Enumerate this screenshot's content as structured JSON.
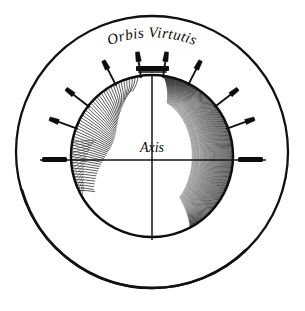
{
  "figure": {
    "title_outer": "Orbis Virtutis",
    "label_axis": "Axis",
    "caption": "",
    "colors": {
      "ink": "#111111",
      "paper": "#ffffff",
      "shade": "#151515"
    }
  },
  "geometry": {
    "canvas": {
      "width": 305,
      "height": 311
    },
    "outer_circle": {
      "cx": 152,
      "cy": 152,
      "r": 136,
      "stroke_width": 2.2
    },
    "sphere": {
      "cx": 152,
      "cy": 156,
      "r": 82,
      "stroke_width": 2.4
    },
    "vertical_axis": {
      "x": 152,
      "y_top": 74,
      "y_bottom": 240
    },
    "horizontal_axis": {
      "y": 160,
      "x_left": 40,
      "x_right": 265
    },
    "pole_cap": {
      "x": 136,
      "y": 68,
      "width": 33,
      "height": 5
    },
    "pivot_left": {
      "x": 42,
      "y": 157,
      "width": 24,
      "height": 5
    },
    "pivot_right": {
      "x": 238,
      "y": 157,
      "width": 24,
      "height": 5
    }
  },
  "rods": [
    {
      "id": "rod-1",
      "angle_deg": 200,
      "length": 30,
      "side": "left"
    },
    {
      "id": "rod-2",
      "angle_deg": 218,
      "length": 30,
      "side": "left"
    },
    {
      "id": "rod-3",
      "angle_deg": 243,
      "length": 28,
      "side": "left-upper"
    },
    {
      "id": "rod-4",
      "angle_deg": 262,
      "length": 26,
      "side": "top-left"
    },
    {
      "id": "rod-5",
      "angle_deg": 278,
      "length": 26,
      "side": "top-right"
    },
    {
      "id": "rod-6",
      "angle_deg": 297,
      "length": 28,
      "side": "right-upper"
    },
    {
      "id": "rod-7",
      "angle_deg": 322,
      "length": 30,
      "side": "right"
    },
    {
      "id": "rod-8",
      "angle_deg": 340,
      "length": 30,
      "side": "right"
    }
  ],
  "shading": {
    "description": "curved contour hatching forming crescent shadow on right and lower limb of sphere",
    "crescent_line_count": 46,
    "bottom_band_line_count": 52
  }
}
